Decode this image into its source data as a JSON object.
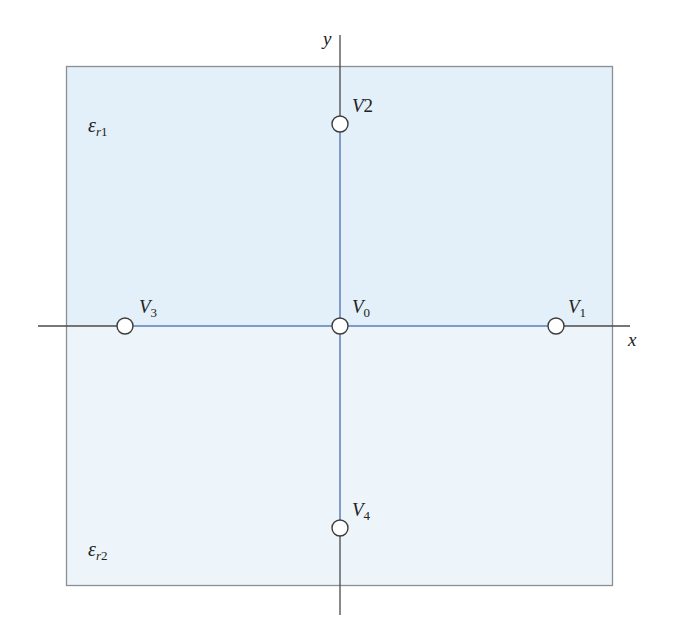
{
  "diagram": {
    "colors": {
      "region_upper": "#e3eff9",
      "region_lower": "#edf5fb",
      "region_border": "#8a8f96",
      "axis_outer": "#4a4a4a",
      "axis_inner": "#5b7fb8",
      "node_fill": "#ffffff",
      "node_stroke": "#3c3c3c",
      "text": "#222222"
    },
    "region": {
      "x": 66,
      "y": 66,
      "width": 546,
      "height": 519,
      "interface_y": 326
    },
    "axes": {
      "x": {
        "label": "x",
        "from": 38,
        "to": 630,
        "y": 326
      },
      "y": {
        "label": "y",
        "from": 35,
        "to": 615,
        "x": 340
      }
    },
    "media": [
      {
        "id": "upper",
        "symbol": "ε",
        "subscript": "r1",
        "x": 88,
        "y": 132
      },
      {
        "id": "lower",
        "symbol": "ε",
        "subscript": "r2",
        "x": 88,
        "y": 556
      }
    ],
    "nodes": [
      {
        "id": "V0",
        "base": "V",
        "sub": "0",
        "cx": 340,
        "cy": 326,
        "label_x": 352,
        "label_y": 313
      },
      {
        "id": "V1",
        "base": "V",
        "sub": "1",
        "cx": 556,
        "cy": 326,
        "label_x": 568,
        "label_y": 313
      },
      {
        "id": "V2",
        "base": "V",
        "sub": "2",
        "cx": 340,
        "cy": 124,
        "label_x": 352,
        "label_y": 112,
        "inline_sub": true
      },
      {
        "id": "V3",
        "base": "V",
        "sub": "3",
        "cx": 125,
        "cy": 326,
        "label_x": 139,
        "label_y": 313
      },
      {
        "id": "V4",
        "base": "V",
        "sub": "4",
        "cx": 340,
        "cy": 528,
        "label_x": 352,
        "label_y": 516
      }
    ],
    "node_radius": 8
  }
}
